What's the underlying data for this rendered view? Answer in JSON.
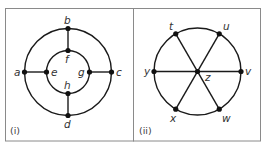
{
  "figure": {
    "panels": [
      {
        "id": "i",
        "label": "(i)",
        "nodes": {
          "a": {
            "label": "a"
          },
          "b": {
            "label": "b"
          },
          "c": {
            "label": "c"
          },
          "d": {
            "label": "d"
          },
          "e": {
            "label": "e"
          },
          "f": {
            "label": "f"
          },
          "g": {
            "label": "g"
          },
          "h": {
            "label": "h"
          }
        },
        "edges": [
          [
            "a",
            "b"
          ],
          [
            "b",
            "c"
          ],
          [
            "c",
            "d"
          ],
          [
            "d",
            "a"
          ],
          [
            "e",
            "f"
          ],
          [
            "f",
            "g"
          ],
          [
            "g",
            "h"
          ],
          [
            "h",
            "e"
          ],
          [
            "a",
            "e"
          ],
          [
            "b",
            "f"
          ],
          [
            "c",
            "g"
          ],
          [
            "d",
            "h"
          ]
        ],
        "description": "Two concentric circles; outer vertices a,b,c,d joined by spokes to inner vertices e,f,g,h"
      },
      {
        "id": "ii",
        "label": "(ii)",
        "nodes": {
          "t": {
            "label": "t"
          },
          "u": {
            "label": "u"
          },
          "v": {
            "label": "v"
          },
          "w": {
            "label": "w"
          },
          "x": {
            "label": "x"
          },
          "y": {
            "label": "y"
          },
          "z": {
            "label": "z"
          }
        },
        "edges": [
          [
            "t",
            "u"
          ],
          [
            "u",
            "v"
          ],
          [
            "v",
            "w"
          ],
          [
            "w",
            "x"
          ],
          [
            "x",
            "y"
          ],
          [
            "y",
            "t"
          ],
          [
            "t",
            "w"
          ],
          [
            "u",
            "x"
          ],
          [
            "y",
            "v"
          ]
        ],
        "description": "Circle through t,u,v,w,x,y with three diameters t–w, u–x, y–v crossing at centre vertex z"
      }
    ],
    "colors": {
      "edge": "#1a1a1a",
      "node": "#111111",
      "frame": "#8a8a8a",
      "label": "#333333"
    }
  }
}
